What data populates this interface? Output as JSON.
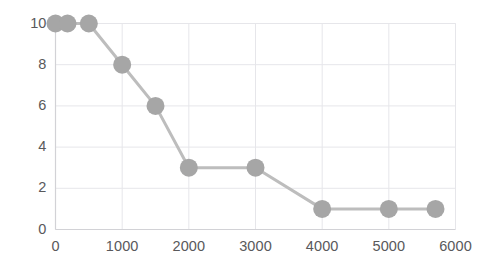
{
  "chart_data": {
    "type": "line",
    "title": "",
    "subtitle": "",
    "xlabel": "",
    "ylabel": "",
    "x": [
      0,
      180,
      500,
      1000,
      1500,
      2000,
      3000,
      4000,
      5000,
      5700
    ],
    "values": [
      10,
      10,
      10,
      8,
      6,
      3,
      3,
      1,
      1,
      1
    ],
    "points": [
      {
        "x": 0,
        "y": 10
      },
      {
        "x": 180,
        "y": 10
      },
      {
        "x": 500,
        "y": 10
      },
      {
        "x": 1000,
        "y": 8
      },
      {
        "x": 1500,
        "y": 6
      },
      {
        "x": 2000,
        "y": 3
      },
      {
        "x": 3000,
        "y": 3
      },
      {
        "x": 4000,
        "y": 1
      },
      {
        "x": 5000,
        "y": 1
      },
      {
        "x": 5700,
        "y": 1
      }
    ],
    "series": [
      {
        "name": "series-1",
        "values": [
          10,
          10,
          10,
          8,
          6,
          3,
          3,
          1,
          1,
          1
        ]
      }
    ],
    "xlim": [
      0,
      6000
    ],
    "ylim": [
      0,
      10
    ],
    "xticks": [
      0,
      1000,
      2000,
      3000,
      4000,
      5000,
      6000
    ],
    "yticks": [
      0,
      2,
      4,
      6,
      8,
      10
    ],
    "xtick_labels": [
      "0",
      "1000",
      "2000",
      "3000",
      "4000",
      "5000",
      "6000"
    ],
    "ytick_labels": [
      "0",
      "2",
      "4",
      "6",
      "8",
      "10"
    ],
    "grid": true,
    "legend": false,
    "legend_position": "none",
    "annotations": [],
    "colors": {
      "line": "#bdbdbd",
      "marker": "#a6a6a6",
      "grid": "#e6e6ea",
      "axis": "#d2d2d6",
      "tick_text": "#59595b",
      "background": "#ffffff"
    },
    "style": {
      "line_width": 3,
      "marker": "circle",
      "marker_size": 9
    }
  }
}
